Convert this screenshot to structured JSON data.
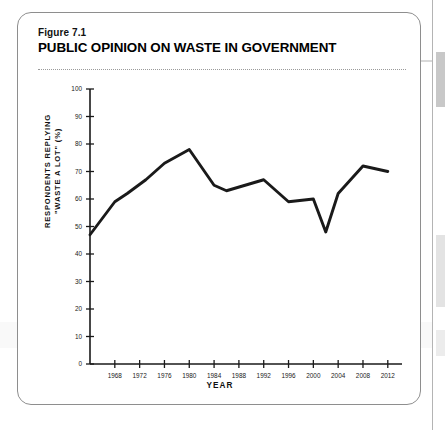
{
  "figure": {
    "number": "Figure 7.1",
    "title": "PUBLIC OPINION ON WASTE IN GOVERNMENT"
  },
  "chart_data": {
    "type": "line",
    "title": "PUBLIC OPINION ON WASTE IN GOVERNMENT",
    "xlabel": "YEAR",
    "ylabel": "RESPONDENTS REPLYING \"WASTE A LOT\" (%)",
    "ylabel_line1": "RESPONDENTS REPLYING",
    "ylabel_line2": "\"WASTE A LOT\" (%)",
    "xlim": [
      1964,
      2013
    ],
    "ylim": [
      0,
      100
    ],
    "grid": false,
    "legend": null,
    "ytick_labels": [
      "0",
      "10",
      "20",
      "30",
      "40",
      "50",
      "60",
      "70",
      "80",
      "90",
      "100"
    ],
    "ytick_values": [
      0,
      10,
      20,
      30,
      40,
      50,
      60,
      70,
      80,
      90,
      100
    ],
    "xtick_labels": [
      "1968",
      "1972",
      "1976",
      "1980",
      "1984",
      "1988",
      "1992",
      "1996",
      "2000",
      "2004",
      "2008",
      "2012"
    ],
    "xtick_values": [
      1968,
      1972,
      1976,
      1980,
      1984,
      1988,
      1992,
      1996,
      2000,
      2004,
      2008,
      2012
    ],
    "series": [
      {
        "name": "Waste a lot",
        "color": "#1a1a1a",
        "x": [
          1964,
          1968,
          1970,
          1973,
          1976,
          1980,
          1984,
          1986,
          1989,
          1992,
          1996,
          2000,
          2002,
          2004,
          2008,
          2012
        ],
        "values": [
          47,
          59,
          62,
          67,
          73,
          78,
          65,
          63,
          65,
          67,
          59,
          60,
          48,
          62,
          72,
          70
        ]
      }
    ]
  }
}
